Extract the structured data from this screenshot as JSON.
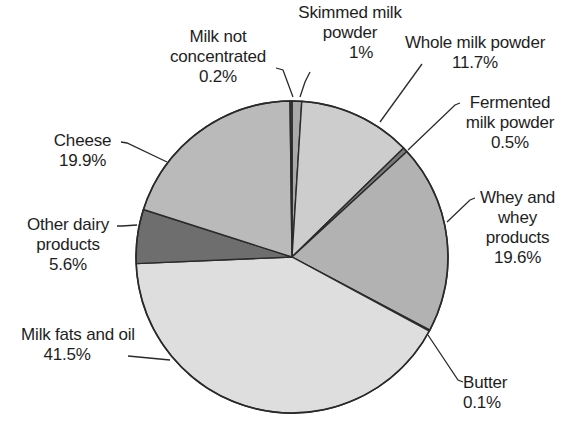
{
  "chart_data": {
    "type": "pie",
    "title": "",
    "legend": "none (direct labels with leader lines)",
    "start_angle_deg": 0,
    "direction": "clockwise from 12 o'clock",
    "slices": [
      {
        "name": "Skimmed milk powder",
        "value": 1.0,
        "label_lines": [
          "Skimmed milk",
          "powder",
          "1%"
        ],
        "fill": "#a9a9a9"
      },
      {
        "name": "Whole milk powder",
        "value": 11.7,
        "label_lines": [
          "Whole milk powder",
          "11.7%"
        ],
        "fill": "#cdcdcd"
      },
      {
        "name": "Fermented milk powder",
        "value": 0.5,
        "label_lines": [
          "Fermented",
          "milk powder",
          "0.5%"
        ],
        "fill": "#7a7a7a"
      },
      {
        "name": "Whey and whey products",
        "value": 19.6,
        "label_lines": [
          "Whey and",
          "whey",
          "products",
          "19.6%"
        ],
        "fill": "#b2b2b2"
      },
      {
        "name": "Butter",
        "value": 0.1,
        "label_lines": [
          "Butter",
          "0.1%"
        ],
        "fill": "#999999"
      },
      {
        "name": "Milk fats and oil",
        "value": 41.5,
        "label_lines": [
          "Milk fats and oil",
          "41.5%"
        ],
        "fill": "#dedede"
      },
      {
        "name": "Other dairy products",
        "value": 5.6,
        "label_lines": [
          "Other dairy",
          "products",
          "5.6%"
        ],
        "fill": "#6e6e6e"
      },
      {
        "name": "Cheese",
        "value": 19.9,
        "label_lines": [
          "Cheese",
          "19.9%"
        ],
        "fill": "#bababa"
      },
      {
        "name": "Milk not concentrated",
        "value": 0.2,
        "label_lines": [
          "Milk not",
          "concentrated",
          "0.2%"
        ],
        "fill": "#555555"
      }
    ]
  },
  "labels": {
    "skimmed": {
      "l1": "Skimmed milk",
      "l2": "powder",
      "l3": "1%"
    },
    "whole": {
      "l1": "Whole milk powder",
      "l2": "11.7%"
    },
    "fermented": {
      "l1": "Fermented",
      "l2": "milk powder",
      "l3": "0.5%"
    },
    "whey": {
      "l1": "Whey and",
      "l2": "whey",
      "l3": "products",
      "l4": "19.6%"
    },
    "butter": {
      "l1": "Butter",
      "l2": "0.1%"
    },
    "milkfats": {
      "l1": "Milk fats and oil",
      "l2": "41.5%"
    },
    "other": {
      "l1": "Other dairy",
      "l2": "products",
      "l3": "5.6%"
    },
    "cheese": {
      "l1": "Cheese",
      "l2": "19.9%"
    },
    "notconc": {
      "l1": "Milk not",
      "l2": "concentrated",
      "l3": "0.2%"
    }
  }
}
